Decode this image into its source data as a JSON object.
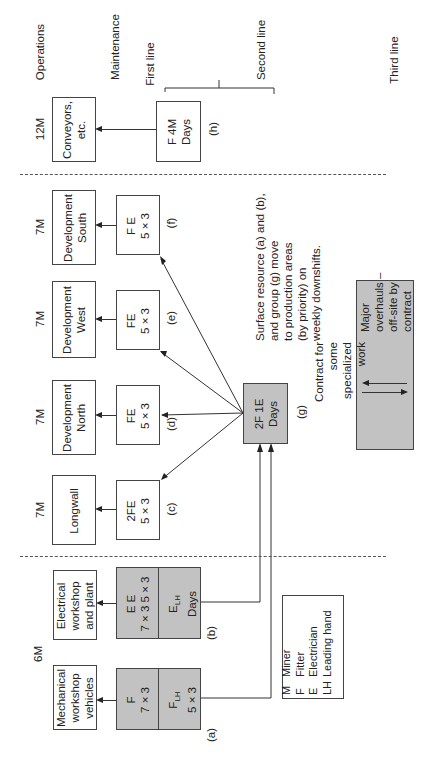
{
  "header_labels": {
    "operations": "Operations",
    "maintenance": "Maintenance",
    "first_line": "First line",
    "second_line": "Second line",
    "third_line": "Third line"
  },
  "operations": [
    {
      "id": "conveyors",
      "label_line1": "Conveyors,",
      "label_line2": "etc.",
      "crew": "12M"
    },
    {
      "id": "dev-south",
      "label_line1": "Development",
      "label_line2": "South",
      "crew": "7M"
    },
    {
      "id": "dev-west",
      "label_line1": "Development",
      "label_line2": "West",
      "crew": "7M"
    },
    {
      "id": "dev-north",
      "label_line1": "Development",
      "label_line2": "North",
      "crew": "7M"
    },
    {
      "id": "longwall",
      "label_line1": "Longwall",
      "label_line2": "",
      "crew": "7M"
    },
    {
      "id": "electrical",
      "label_line1": "Electrical",
      "label_line2": "workshop",
      "label_line3": "and plant",
      "crew": "6M"
    },
    {
      "id": "mechanical",
      "label_line1": "Mechanical",
      "label_line2": "workshop",
      "label_line3": "vehicles"
    }
  ],
  "maintenance": {
    "h": {
      "line1": "F 4M",
      "line2": "Days",
      "tag": "(h)"
    },
    "f": {
      "line1": "F E",
      "line2": "5 × 3",
      "tag": "(f)"
    },
    "e": {
      "line1": "FE",
      "line2": "5 × 3",
      "tag": "(e)"
    },
    "d": {
      "line1": "FE",
      "line2": "5 × 3",
      "tag": "(d)"
    },
    "c": {
      "line1": "2FE",
      "line2": "5 × 3",
      "tag": "(c)"
    },
    "b": {
      "top_line1": "E   E",
      "top_line2": "7 × 3   5 × 3",
      "bottom_main": "E",
      "bottom_sub": "LH",
      "bottom_line2": "Days",
      "tag": "(b)"
    },
    "a": {
      "top_line1": "F",
      "top_line2": "7 × 3",
      "bottom_main": "F",
      "bottom_sub": "LH",
      "bottom_line2": "5 × 3",
      "tag": "(a)"
    },
    "g": {
      "line1": "2F 1E",
      "line2": "Days",
      "tag": "(g)"
    }
  },
  "note": {
    "lines": [
      "Surface resource (a) and (b),",
      "and group (g) move",
      "to production areas",
      "(by priority) on",
      "weekly downshifts."
    ]
  },
  "contract_box": {
    "left_lines": [
      "Contract for",
      "some",
      "specialized",
      "work"
    ],
    "right_lines": [
      "Major",
      "overhauls –",
      "off-site by",
      "contract"
    ]
  },
  "legend": {
    "items": [
      {
        "code": "M",
        "meaning": "Miner"
      },
      {
        "code": "F",
        "meaning": "Fitter"
      },
      {
        "code": "E",
        "meaning": "Electrician"
      },
      {
        "code": "LH",
        "meaning": "Leading hand"
      }
    ]
  },
  "colors": {
    "shaded_box": "#c2c2c2",
    "line": "#333333"
  }
}
